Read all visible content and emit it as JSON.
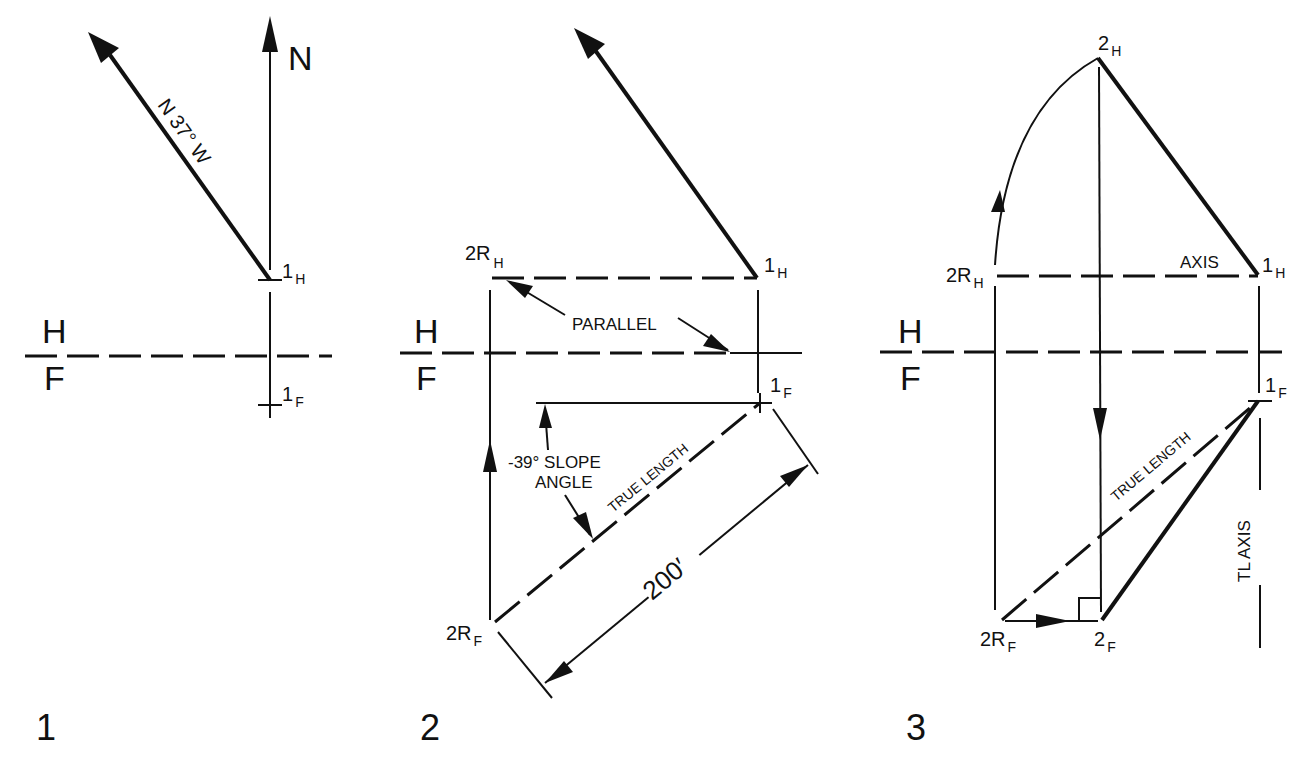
{
  "figure": {
    "colors": {
      "ink": "#111111",
      "background": "#ffffff"
    },
    "panels": [
      {
        "number": "1",
        "north_label": "N",
        "bearing_label": "N 37° W",
        "plane_top": "H",
        "plane_bottom": "F",
        "points": [
          {
            "main": "1",
            "sub": "H"
          },
          {
            "main": "1",
            "sub": "F"
          }
        ]
      },
      {
        "number": "2",
        "plane_top": "H",
        "plane_bottom": "F",
        "parallel_label": "PARALLEL",
        "slope_label_line1": "-39° SLOPE",
        "slope_label_line2": "ANGLE",
        "true_length_label": "TRUE LENGTH",
        "dimension_label": "200′",
        "points": [
          {
            "main": "2R",
            "sub": "H"
          },
          {
            "main": "1",
            "sub": "H"
          },
          {
            "main": "1",
            "sub": "F"
          },
          {
            "main": "2R",
            "sub": "F"
          }
        ]
      },
      {
        "number": "3",
        "plane_top": "H",
        "plane_bottom": "F",
        "axis_label": "AXIS",
        "true_length_label": "TRUE LENGTH",
        "tl_axis_label": "TL  AXIS",
        "points": [
          {
            "main": "2",
            "sub": "H"
          },
          {
            "main": "2R",
            "sub": "H"
          },
          {
            "main": "1",
            "sub": "H"
          },
          {
            "main": "1",
            "sub": "F"
          },
          {
            "main": "2R",
            "sub": "F"
          },
          {
            "main": "2",
            "sub": "F"
          }
        ]
      }
    ]
  }
}
